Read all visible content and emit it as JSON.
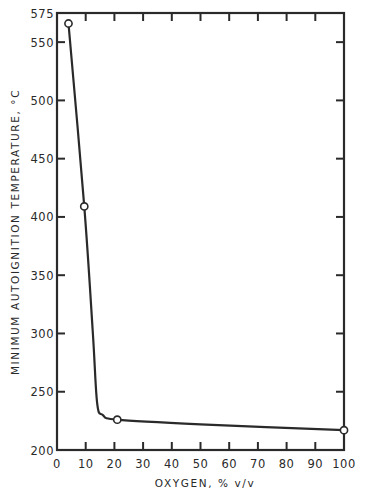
{
  "chart_data": {
    "type": "line",
    "title": "",
    "xlabel": "OXYGEN, % v/v",
    "ylabel": "MINIMUM AUTOIGNITION TEMPERATURE, °C",
    "xlim": [
      0,
      100
    ],
    "ylim": [
      200,
      575
    ],
    "x_ticks": [
      0,
      10,
      20,
      30,
      40,
      50,
      60,
      70,
      80,
      90,
      100
    ],
    "y_ticks": [
      200,
      250,
      300,
      350,
      400,
      450,
      500,
      550,
      575
    ],
    "grid": false,
    "legend": null,
    "series": [
      {
        "name": "Minimum autoignition temperature",
        "markers": "open-circle",
        "points": [
          {
            "x": 4,
            "y": 566
          },
          {
            "x": 9.5,
            "y": 409
          },
          {
            "x": 21,
            "y": 226
          },
          {
            "x": 100,
            "y": 217
          }
        ]
      }
    ],
    "curve_path_points": [
      {
        "x": 4,
        "y": 566
      },
      {
        "x": 9.5,
        "y": 409
      },
      {
        "x": 12.5,
        "y": 300
      },
      {
        "x": 14,
        "y": 240
      },
      {
        "x": 16,
        "y": 230
      },
      {
        "x": 21,
        "y": 226
      },
      {
        "x": 50,
        "y": 222
      },
      {
        "x": 100,
        "y": 217
      }
    ]
  },
  "colors": {
    "ink": "#2a2a2a",
    "background": "#ffffff"
  }
}
